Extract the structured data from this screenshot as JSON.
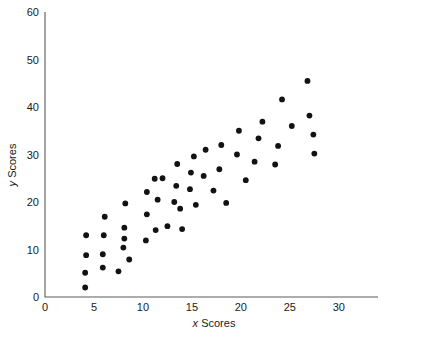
{
  "chart_data": {
    "type": "scatter",
    "title": "",
    "xlabel": "x Scores",
    "ylabel": "y Scores",
    "xlim": [
      0,
      34
    ],
    "ylim": [
      0,
      60
    ],
    "xticks": [
      0,
      5,
      10,
      15,
      20,
      25,
      30
    ],
    "yticks": [
      0,
      10,
      20,
      30,
      40,
      50,
      60
    ],
    "xtick_labels": [
      "0",
      "5",
      "10",
      "15",
      "20",
      "25",
      "30"
    ],
    "ytick_labels": [
      "0",
      "10",
      "20",
      "30",
      "40",
      "50",
      "60"
    ],
    "grid": false,
    "legend": false,
    "marker": "circle",
    "marker_color": "#121212",
    "axis_color": "#5a5a5a",
    "points": [
      [
        4.1,
        2.0
      ],
      [
        4.1,
        5.1
      ],
      [
        4.2,
        8.8
      ],
      [
        4.2,
        13.0
      ],
      [
        5.9,
        6.2
      ],
      [
        5.9,
        9.0
      ],
      [
        6.0,
        13.0
      ],
      [
        6.1,
        16.9
      ],
      [
        7.5,
        5.4
      ],
      [
        8.0,
        10.4
      ],
      [
        8.1,
        12.3
      ],
      [
        8.1,
        14.6
      ],
      [
        8.2,
        19.7
      ],
      [
        8.6,
        7.9
      ],
      [
        10.3,
        11.9
      ],
      [
        10.4,
        17.4
      ],
      [
        10.4,
        22.1
      ],
      [
        11.2,
        24.9
      ],
      [
        11.3,
        14.1
      ],
      [
        11.5,
        20.5
      ],
      [
        12.0,
        25.0
      ],
      [
        12.5,
        14.9
      ],
      [
        13.2,
        20.0
      ],
      [
        13.4,
        23.4
      ],
      [
        13.5,
        28.0
      ],
      [
        13.8,
        18.6
      ],
      [
        14.0,
        14.3
      ],
      [
        14.8,
        22.7
      ],
      [
        14.9,
        26.2
      ],
      [
        15.2,
        29.6
      ],
      [
        15.4,
        19.4
      ],
      [
        16.2,
        25.5
      ],
      [
        16.4,
        31.0
      ],
      [
        17.2,
        22.4
      ],
      [
        17.8,
        26.9
      ],
      [
        18.0,
        32.0
      ],
      [
        18.5,
        19.8
      ],
      [
        19.6,
        30.0
      ],
      [
        19.8,
        35.0
      ],
      [
        20.5,
        24.6
      ],
      [
        21.4,
        28.5
      ],
      [
        21.8,
        33.4
      ],
      [
        22.2,
        36.9
      ],
      [
        23.5,
        27.9
      ],
      [
        23.8,
        31.8
      ],
      [
        24.2,
        41.6
      ],
      [
        25.2,
        36.0
      ],
      [
        26.8,
        45.5
      ],
      [
        27.0,
        38.2
      ],
      [
        27.4,
        34.2
      ],
      [
        27.5,
        30.2
      ]
    ]
  },
  "axes": {
    "y_axis_label_italic": "y",
    "y_axis_label_rest": " Scores",
    "x_axis_label_italic": "x",
    "x_axis_label_rest": " Scores"
  }
}
